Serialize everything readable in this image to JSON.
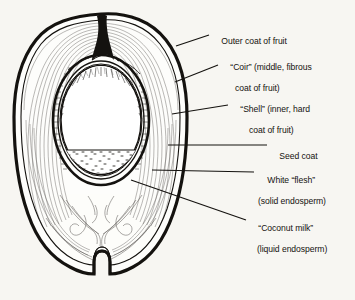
{
  "figure": {
    "subject": "coconut",
    "style": "black-and-white line engraving",
    "background_color": "#f7f6f2",
    "ink_color": "#14120f"
  },
  "labels": [
    {
      "id": "outer-coat",
      "line1": "Outer coat of fruit",
      "line2": "",
      "x": 212,
      "y": 30,
      "leader": {
        "x1": 209,
        "y1": 35,
        "x2": 176,
        "y2": 46
      }
    },
    {
      "id": "coir",
      "line1": "“Coir” (middle, fibrous",
      "line2": "coat of fruit)",
      "x": 221,
      "y": 56,
      "leader": {
        "x1": 218,
        "y1": 65,
        "x2": 175,
        "y2": 82
      }
    },
    {
      "id": "shell",
      "line1": "“Shell” (inner, hard",
      "line2": "coat of fruit)",
      "x": 231,
      "y": 98,
      "leader": {
        "x1": 228,
        "y1": 105,
        "x2": 172,
        "y2": 114
      }
    },
    {
      "id": "seed-coat",
      "line1": "Seed coat",
      "line2": "",
      "x": 270,
      "y": 140,
      "leader": {
        "x1": 267,
        "y1": 145,
        "x2": 168,
        "y2": 145
      }
    },
    {
      "id": "white-flesh",
      "line1": "White “flesh”",
      "line2": "(solid endosperm)",
      "x": 258,
      "y": 167,
      "leader": {
        "x1": 254,
        "y1": 172,
        "x2": 152,
        "y2": 170
      }
    },
    {
      "id": "coconut-milk",
      "line1": "“Coconut milk”",
      "line2": "(liquid endosperm)",
      "x": 249,
      "y": 215,
      "leader": {
        "x1": 246,
        "y1": 220,
        "x2": 131,
        "y2": 180
      }
    }
  ],
  "anatomy": {
    "husk_outline": "egg-shaped body with notched base and apex wedge",
    "shell_ring": "elliptical hard shell band",
    "flesh_region": "white solid endosperm lining upper cavity",
    "milk_region": "stippled liquid endosperm in lower cavity",
    "fluid_line_y": 150,
    "apex_notch": "dark wedge at top",
    "base_notch": "stem scar notch at bottom"
  }
}
